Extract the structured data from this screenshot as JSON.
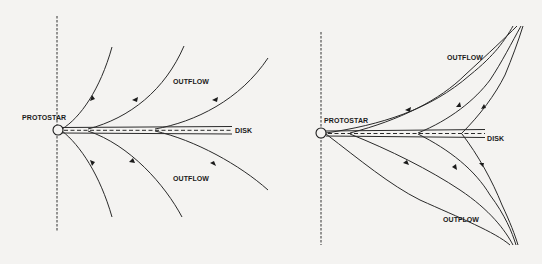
{
  "left_panel": {
    "protostar_label": "PROTOSTAR",
    "disk_label": "DISK",
    "outflow_top_label": "OUTFLOW",
    "outflow_bottom_label": "OUTFLOW"
  },
  "right_panel": {
    "protostar_label": "PROTOSTAR",
    "disk_label": "DISK",
    "outflow_top_label": "OUTFLOW",
    "outflow_bottom_label": "OUTFLOW"
  },
  "colors": {
    "background": "#f4f3f1",
    "line": "#2a2a2a"
  }
}
